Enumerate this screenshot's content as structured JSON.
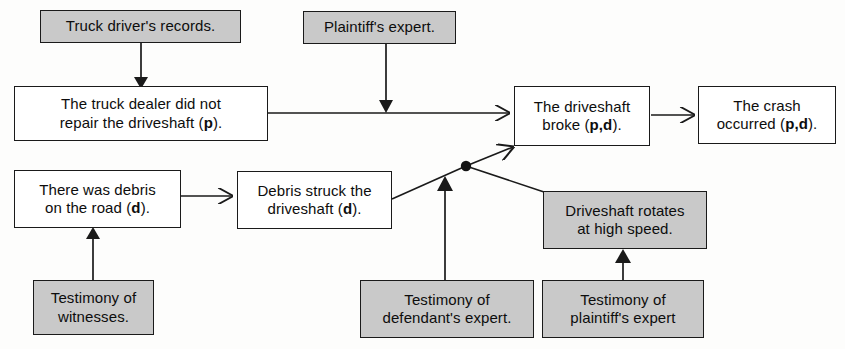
{
  "diagram": {
    "colors": {
      "claim_fill": "#ffffff",
      "evidence_fill": "#c9c9c9",
      "stroke": "#1a1a1a",
      "background": "#fdfdfc"
    },
    "nodes": [
      {
        "id": "truck-driver-records",
        "kind": "evidence",
        "text": "Truck driver's records.",
        "x": 40,
        "y": 10,
        "w": 201,
        "h": 33,
        "font": 15
      },
      {
        "id": "plaintiffs-expert-top",
        "kind": "evidence",
        "text": "Plaintiff's expert.",
        "x": 303,
        "y": 11,
        "w": 153,
        "h": 33,
        "font": 15
      },
      {
        "id": "truck-dealer-did-not-repair",
        "kind": "claim",
        "text": "The truck dealer did not\nrepair the driveshaft (p).",
        "bold": [
          "p"
        ],
        "x": 14,
        "y": 86,
        "w": 254,
        "h": 55,
        "font": 15
      },
      {
        "id": "driveshaft-broke",
        "kind": "claim",
        "text": "The driveshaft\nbroke (p,d).",
        "bold": [
          "p,d"
        ],
        "x": 514,
        "y": 86,
        "w": 136,
        "h": 60,
        "font": 15
      },
      {
        "id": "crash-occurred",
        "kind": "claim",
        "text": "The crash\noccurred (p,d).",
        "bold": [
          "p,d"
        ],
        "x": 698,
        "y": 86,
        "w": 138,
        "h": 58,
        "font": 15
      },
      {
        "id": "debris-on-road",
        "kind": "claim",
        "text": "There was debris\non the road (d).",
        "bold": [
          "d"
        ],
        "x": 14,
        "y": 170,
        "w": 167,
        "h": 58,
        "font": 15
      },
      {
        "id": "debris-struck-driveshaft",
        "kind": "claim",
        "text": "Debris struck the\ndriveshaft (d).",
        "bold": [
          "d"
        ],
        "x": 237,
        "y": 171,
        "w": 155,
        "h": 58,
        "font": 15
      },
      {
        "id": "driveshaft-rotates",
        "kind": "evidence",
        "text": "Driveshaft rotates\nat high speed.",
        "x": 543,
        "y": 191,
        "w": 164,
        "h": 58,
        "font": 15
      },
      {
        "id": "testimony-of-witnesses",
        "kind": "evidence",
        "text": "Testimony of\nwitnesses.",
        "x": 33,
        "y": 280,
        "w": 121,
        "h": 55,
        "font": 15
      },
      {
        "id": "testimony-defendants-expert",
        "kind": "evidence",
        "text": "Testimony of\ndefendant's expert.",
        "x": 360,
        "y": 280,
        "w": 174,
        "h": 58,
        "font": 15
      },
      {
        "id": "testimony-plaintiffs-expert",
        "kind": "evidence",
        "text": "Testimony of\nplaintiff's expert",
        "x": 542,
        "y": 280,
        "w": 162,
        "h": 58,
        "font": 15
      }
    ],
    "edges": [
      {
        "id": "records-to-dealer",
        "from": "truck-driver-records",
        "to": "truck-dealer-did-not-repair",
        "arrow": "solid-down",
        "path": "M 141 43 L 141 84"
      },
      {
        "id": "plaintiff-expert-to-driveshaft-line",
        "from": "plaintiffs-expert-top",
        "to": "driveshaft-broke",
        "arrow": "solid-down",
        "path": "M 386 44 L 386 107"
      },
      {
        "id": "dealer-to-driveshaft-broke",
        "from": "truck-dealer-did-not-repair",
        "to": "driveshaft-broke",
        "arrow": "open-right",
        "path": "M 268 113 L 512 113"
      },
      {
        "id": "driveshaft-broke-to-crash",
        "from": "driveshaft-broke",
        "to": "crash-occurred",
        "arrow": "open-right",
        "path": "M 650 115 L 696 115"
      },
      {
        "id": "debris-road-to-debris-struck",
        "from": "debris-on-road",
        "to": "debris-struck-driveshaft",
        "arrow": "open-right",
        "path": "M 181 196 L 235 196"
      },
      {
        "id": "witnesses-to-debris-road",
        "from": "testimony-of-witnesses",
        "to": "debris-on-road",
        "arrow": "solid-up",
        "path": "M 93 280 L 93 231"
      },
      {
        "id": "debris-struck-to-junction",
        "from": "debris-struck-driveshaft",
        "to": "convergence-node",
        "arrow": "none",
        "path": "M 392 199 L 466 166"
      },
      {
        "id": "junction-to-driveshaft-broke",
        "from": "convergence-node",
        "to": "driveshaft-broke",
        "arrow": "open-upright",
        "path": "M 466 166 L 516 146"
      },
      {
        "id": "defendants-expert-to-junction",
        "from": "testimony-defendants-expert",
        "to": "convergence-node",
        "arrow": "solid-up",
        "path": "M 445 280 L 445 178"
      },
      {
        "id": "junction-to-driveshaft-rotates",
        "from": "convergence-node",
        "to": "driveshaft-rotates",
        "arrow": "none",
        "path": "M 466 166 L 543 192"
      },
      {
        "id": "plaintiffs-expert-to-rotates",
        "from": "testimony-plaintiffs-expert",
        "to": "driveshaft-rotates",
        "arrow": "solid-up",
        "path": "M 623 280 L 623 252"
      }
    ],
    "convergence_node": {
      "id": "convergence-node",
      "x": 466,
      "y": 166,
      "r": 5
    }
  }
}
